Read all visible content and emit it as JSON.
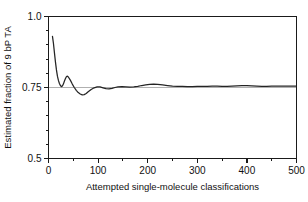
{
  "chart_data": {
    "type": "line",
    "title": "",
    "xlabel": "Attempted single-molecule classifications",
    "ylabel": "Estimated fraction of 9 bP TA",
    "xlim": [
      0,
      500
    ],
    "ylim": [
      0.5,
      1.0
    ],
    "grid": false,
    "legend": null,
    "xticks": [
      0,
      100,
      200,
      300,
      400,
      500
    ],
    "xticklabels": [
      "0",
      "100",
      "200",
      "300",
      "400",
      "500"
    ],
    "xminorticks": [
      50,
      150,
      250,
      350,
      450
    ],
    "yticks": [
      0.5,
      0.75,
      1.0
    ],
    "yticklabels": [
      "0.5",
      "0.75",
      "1.0"
    ],
    "yminorticks": [
      0.55,
      0.6,
      0.65,
      0.7,
      0.8,
      0.85,
      0.9,
      0.95
    ],
    "reference_lines": [
      {
        "orientation": "horizontal",
        "value": 0.75,
        "color": "#b0b0b0"
      }
    ],
    "series": [
      {
        "name": "estimated fraction",
        "color": "#242424",
        "x": [
          8,
          10,
          12,
          14,
          16,
          18,
          20,
          22,
          24,
          26,
          28,
          30,
          32,
          34,
          36,
          38,
          40,
          44,
          48,
          52,
          56,
          60,
          64,
          68,
          72,
          76,
          80,
          86,
          92,
          98,
          104,
          110,
          116,
          122,
          128,
          134,
          140,
          148,
          156,
          164,
          172,
          180,
          188,
          196,
          204,
          212,
          220,
          230,
          240,
          250,
          260,
          270,
          280,
          290,
          300,
          310,
          320,
          330,
          340,
          350,
          360,
          370,
          380,
          390,
          400,
          410,
          420,
          430,
          440,
          450,
          460,
          470,
          480,
          490,
          500
        ],
        "y": [
          0.93,
          0.905,
          0.872,
          0.84,
          0.812,
          0.79,
          0.775,
          0.764,
          0.757,
          0.753,
          0.755,
          0.762,
          0.772,
          0.781,
          0.788,
          0.79,
          0.787,
          0.776,
          0.762,
          0.75,
          0.74,
          0.732,
          0.727,
          0.724,
          0.725,
          0.729,
          0.735,
          0.743,
          0.749,
          0.752,
          0.752,
          0.749,
          0.746,
          0.745,
          0.747,
          0.75,
          0.752,
          0.753,
          0.752,
          0.751,
          0.752,
          0.754,
          0.757,
          0.759,
          0.761,
          0.762,
          0.761,
          0.759,
          0.757,
          0.755,
          0.754,
          0.754,
          0.753,
          0.753,
          0.754,
          0.754,
          0.754,
          0.755,
          0.755,
          0.754,
          0.754,
          0.755,
          0.756,
          0.757,
          0.757,
          0.756,
          0.755,
          0.754,
          0.754,
          0.755,
          0.755,
          0.755,
          0.755,
          0.755,
          0.755
        ]
      }
    ]
  }
}
